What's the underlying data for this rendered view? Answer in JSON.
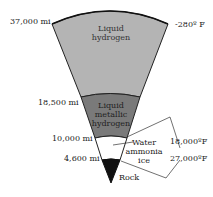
{
  "diagram": {
    "title": "",
    "layers": [
      {
        "name": "Liquid hydrogen",
        "line1": "Liquid",
        "line2": "hydrogen",
        "color": "#b4b4b4"
      },
      {
        "name": "Liquid metallic hydrogen",
        "line1": "Liquid",
        "line2": "metallic",
        "line3": "hydrogen",
        "color": "#7a7a7a"
      },
      {
        "name": "Water ammonia ice",
        "line1": "Water",
        "line2": "ammonia",
        "line3": "ice",
        "color": "#ffffff"
      },
      {
        "name": "Rock",
        "label": "Rock",
        "color": "#111111"
      }
    ],
    "radii": [
      "37,000 mi",
      "18,500 mi",
      "10,000 mi",
      "4,600 mi"
    ],
    "temperatures": {
      "surface": "-280º F",
      "t1": "18,000ºF",
      "t2": "27,000ºF"
    }
  }
}
